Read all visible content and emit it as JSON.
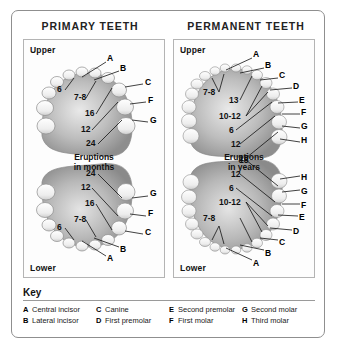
{
  "figure": {
    "titles": [
      "PRIMARY TEETH",
      "PERMANENT TEETH"
    ]
  },
  "primary": {
    "title": "PRIMARY TEETH",
    "upper_label": "Upper",
    "lower_label": "Lower",
    "eruptions_caption_line1": "Eruptions",
    "eruptions_caption_line2": "in months",
    "upper_letters": [
      "A",
      "B",
      "C",
      "F",
      "G"
    ],
    "upper_numbers": [
      "6",
      "7-8",
      "16",
      "12",
      "24"
    ],
    "lower_letters": [
      "G",
      "F",
      "C",
      "B",
      "A"
    ],
    "lower_numbers": [
      "24",
      "12",
      "16",
      "7-8",
      "6"
    ]
  },
  "permanent": {
    "title": "PERMANENT TEETH",
    "upper_label": "Upper",
    "lower_label": "Lower",
    "eruptions_caption_line1": "Eruptions",
    "eruptions_caption_line2": "in years",
    "upper_letters": [
      "A",
      "B",
      "C",
      "D",
      "E",
      "F",
      "G",
      "H"
    ],
    "upper_numbers": [
      "7-8",
      "13",
      "10-12",
      "6",
      "12",
      "18"
    ],
    "lower_letters": [
      "H",
      "G",
      "F",
      "E",
      "D",
      "C",
      "B",
      "A"
    ],
    "lower_numbers": [
      "18",
      "12",
      "6",
      "10-12",
      "7-8"
    ]
  },
  "key": {
    "title": "Key",
    "columns": [
      [
        {
          "letter": "A",
          "name": "Central incisor"
        },
        {
          "letter": "B",
          "name": "Lateral incisor"
        }
      ],
      [
        {
          "letter": "C",
          "name": "Canine"
        },
        {
          "letter": "D",
          "name": "First premolar"
        }
      ],
      [
        {
          "letter": "E",
          "name": "Second premolar"
        },
        {
          "letter": "F",
          "name": "First molar"
        }
      ],
      [
        {
          "letter": "G",
          "name": "Second molar"
        },
        {
          "letter": "H",
          "name": "Third molar"
        }
      ]
    ]
  }
}
